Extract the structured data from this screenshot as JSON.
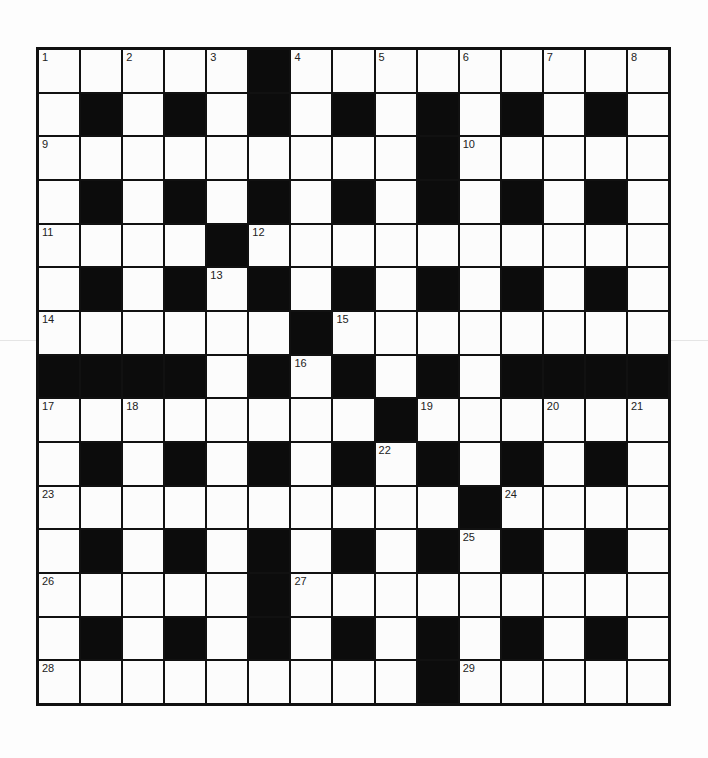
{
  "puzzle": {
    "rows": 15,
    "cols": 15,
    "colors": {
      "black_cell": "#0c0c0c",
      "white_cell": "#fcfcfc",
      "grid_line": "#111111",
      "number_text": "#222222"
    },
    "layout": [
      ".....#.........",
      ".#.#.#.#.#.#.#.",
      ".........#.....",
      ".#.#.#.#.#.#.#.",
      "....#..........",
      ".#.#.#.#.#.#.#.",
      "......#........",
      "####.#.#.#.####",
      "........#......",
      ".#.#.#.#.#.#.#.",
      "..........#....",
      ".#.#.#.#.#.#.#.",
      ".....#.........",
      ".#.#.#.#.#.#.#.",
      ".........#....."
    ],
    "numbers": [
      {
        "row": 0,
        "col": 0,
        "n": "1"
      },
      {
        "row": 0,
        "col": 2,
        "n": "2"
      },
      {
        "row": 0,
        "col": 4,
        "n": "3"
      },
      {
        "row": 0,
        "col": 6,
        "n": "4"
      },
      {
        "row": 0,
        "col": 8,
        "n": "5"
      },
      {
        "row": 0,
        "col": 10,
        "n": "6"
      },
      {
        "row": 0,
        "col": 12,
        "n": "7"
      },
      {
        "row": 0,
        "col": 14,
        "n": "8"
      },
      {
        "row": 2,
        "col": 0,
        "n": "9"
      },
      {
        "row": 2,
        "col": 10,
        "n": "10"
      },
      {
        "row": 4,
        "col": 0,
        "n": "11"
      },
      {
        "row": 4,
        "col": 5,
        "n": "12"
      },
      {
        "row": 5,
        "col": 4,
        "n": "13"
      },
      {
        "row": 6,
        "col": 0,
        "n": "14"
      },
      {
        "row": 6,
        "col": 7,
        "n": "15"
      },
      {
        "row": 7,
        "col": 6,
        "n": "16"
      },
      {
        "row": 8,
        "col": 0,
        "n": "17"
      },
      {
        "row": 8,
        "col": 2,
        "n": "18"
      },
      {
        "row": 8,
        "col": 9,
        "n": "19"
      },
      {
        "row": 8,
        "col": 12,
        "n": "20"
      },
      {
        "row": 8,
        "col": 14,
        "n": "21"
      },
      {
        "row": 9,
        "col": 8,
        "n": "22"
      },
      {
        "row": 10,
        "col": 0,
        "n": "23"
      },
      {
        "row": 10,
        "col": 11,
        "n": "24"
      },
      {
        "row": 11,
        "col": 10,
        "n": "25"
      },
      {
        "row": 12,
        "col": 0,
        "n": "26"
      },
      {
        "row": 12,
        "col": 6,
        "n": "27"
      },
      {
        "row": 14,
        "col": 0,
        "n": "28"
      },
      {
        "row": 14,
        "col": 10,
        "n": "29"
      }
    ]
  }
}
